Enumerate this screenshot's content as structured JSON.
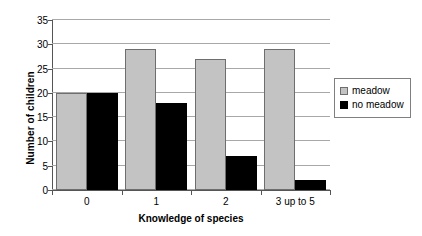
{
  "chart_data": {
    "type": "bar",
    "title": "",
    "subtitle": "",
    "xlabel": "Knowledge of species",
    "ylabel": "Number of children",
    "categories": [
      "0",
      "1",
      "2",
      "3 up to 5"
    ],
    "series": [
      {
        "name": "meadow",
        "color": "#c3c3c3",
        "values": [
          20,
          29,
          27,
          29
        ]
      },
      {
        "name": "no meadow",
        "color": "#000000",
        "values": [
          20,
          18,
          7,
          2
        ]
      }
    ],
    "ylim": [
      0,
      35
    ],
    "ytick_step": 5,
    "yticks": [
      "0",
      "5",
      "10",
      "15",
      "20",
      "25",
      "30",
      "35"
    ],
    "ytick_values": [
      0,
      5,
      10,
      15,
      20,
      25,
      30,
      35
    ],
    "grid": "horizontal",
    "grid_color": "#a8a8a8",
    "legend_position": "right",
    "legend_entries": [
      "meadow",
      "no meadow"
    ],
    "background": "#ffffff",
    "axis_color": "#555555",
    "bar_border_color": "#6e6e6e",
    "annotations": []
  }
}
